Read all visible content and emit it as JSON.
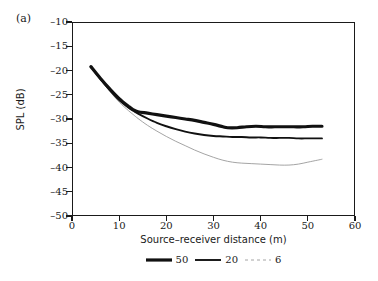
{
  "panel": {
    "label": "(a)"
  },
  "chart_data": {
    "type": "line",
    "title": "",
    "xlabel": "Source–receiver distance (m)",
    "ylabel": "SPL (dB)",
    "xlim": [
      0,
      60
    ],
    "ylim": [
      -50,
      -10
    ],
    "xticks": [
      0,
      10,
      20,
      30,
      40,
      50,
      60
    ],
    "yticks": [
      -10,
      -15,
      -20,
      -25,
      -30,
      -35,
      -40,
      -45,
      -50
    ],
    "grid": false,
    "legend_position": "below",
    "series": [
      {
        "name": "50",
        "label": "50",
        "color": "#111111",
        "width": 3.2,
        "dash": "none",
        "x": [
          4,
          6,
          8,
          10,
          12,
          13,
          14,
          16,
          18,
          20,
          22,
          24,
          26,
          28,
          30,
          32,
          33,
          35,
          37,
          39,
          41,
          43,
          45,
          47,
          49,
          51,
          53
        ],
        "y": [
          -19.2,
          -21.6,
          -23.8,
          -25.8,
          -27.4,
          -28.1,
          -28.5,
          -28.8,
          -29.1,
          -29.4,
          -29.7,
          -30.0,
          -30.3,
          -30.7,
          -31.1,
          -31.6,
          -31.8,
          -31.8,
          -31.6,
          -31.5,
          -31.6,
          -31.6,
          -31.6,
          -31.6,
          -31.6,
          -31.5,
          -31.5
        ]
      },
      {
        "name": "20",
        "label": "20",
        "color": "#111111",
        "width": 1.9,
        "dash": "none",
        "x": [
          4,
          6,
          8,
          10,
          12,
          13,
          14,
          16,
          18,
          20,
          22,
          24,
          26,
          28,
          30,
          32,
          34,
          36,
          38,
          40,
          42,
          44,
          46,
          48,
          50,
          52,
          53
        ],
        "y": [
          -19.2,
          -21.7,
          -24.0,
          -26.1,
          -27.7,
          -28.3,
          -28.9,
          -29.9,
          -30.8,
          -31.5,
          -32.1,
          -32.6,
          -33.0,
          -33.3,
          -33.5,
          -33.6,
          -33.7,
          -33.7,
          -33.8,
          -33.8,
          -33.9,
          -33.9,
          -33.9,
          -34.0,
          -34.0,
          -34.0,
          -34.0
        ]
      },
      {
        "name": "6",
        "label": "6",
        "color": "#9a9a9a",
        "width": 0.9,
        "dash": "none",
        "x": [
          4,
          6,
          8,
          10,
          12,
          13,
          14,
          16,
          18,
          20,
          22,
          24,
          26,
          28,
          30,
          32,
          34,
          36,
          38,
          40,
          42,
          44,
          46,
          48,
          50,
          52,
          53
        ],
        "y": [
          -19.3,
          -21.9,
          -24.3,
          -26.5,
          -28.3,
          -29.1,
          -29.9,
          -31.3,
          -32.5,
          -33.6,
          -34.6,
          -35.5,
          -36.4,
          -37.2,
          -37.9,
          -38.5,
          -38.9,
          -39.1,
          -39.2,
          -39.3,
          -39.4,
          -39.5,
          -39.5,
          -39.3,
          -38.9,
          -38.5,
          -38.3
        ]
      }
    ],
    "legend_entries": [
      {
        "label": "50",
        "color": "#111111",
        "width": 3.2,
        "dash": "none"
      },
      {
        "label": "20",
        "color": "#111111",
        "width": 1.9,
        "dash": "none"
      },
      {
        "label": "6",
        "color": "#9a9a9a",
        "width": 0.9,
        "dash": "3,3"
      }
    ]
  }
}
